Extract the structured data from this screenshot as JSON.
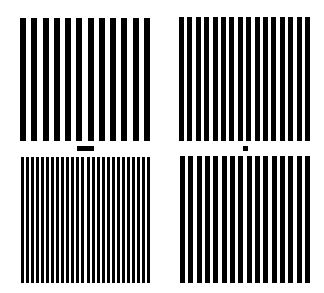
{
  "figure": {
    "background": "#ffffff",
    "foreground": "#000000",
    "panels": [
      {
        "name": "top-left-grating",
        "x": 20,
        "y": 18,
        "w": 130,
        "h": 123,
        "bars": 12,
        "bar_width": 6
      },
      {
        "name": "top-right-grating",
        "x": 179,
        "y": 17,
        "w": 131,
        "h": 124,
        "bars": 16,
        "bar_width": 5
      },
      {
        "name": "bottom-left-grating",
        "x": 21,
        "y": 157,
        "w": 129,
        "h": 126,
        "bars": 26,
        "bar_width": 3
      },
      {
        "name": "bottom-right-grating",
        "x": 180,
        "y": 156,
        "w": 130,
        "h": 127,
        "bars": 16,
        "bar_width": 5
      }
    ],
    "scale_markers": [
      {
        "name": "scale-bar-rect",
        "x": 77,
        "y": 146,
        "w": 17,
        "h": 5
      },
      {
        "name": "scale-bar-square",
        "x": 243,
        "y": 146,
        "w": 5,
        "h": 5
      }
    ]
  }
}
